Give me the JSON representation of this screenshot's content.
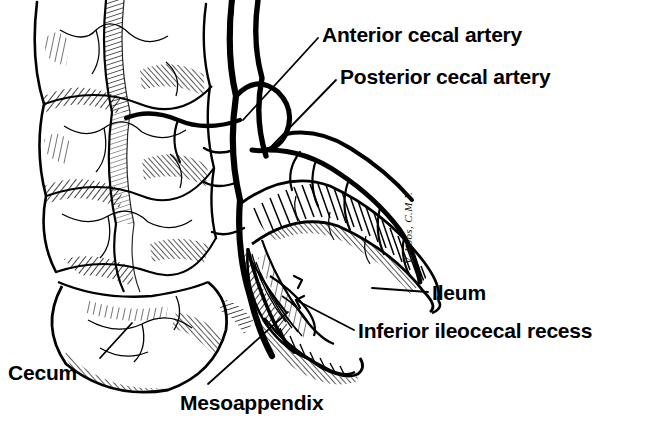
{
  "figure": {
    "type": "anatomical-line-illustration",
    "background_color": "#ffffff",
    "ink_color": "#000000",
    "signature": "V. Loos, C.M.I."
  },
  "labels": [
    {
      "id": "anterior-cecal-artery",
      "text": "Anterior cecal artery",
      "x": 322,
      "y": 24,
      "size": 21
    },
    {
      "id": "posterior-cecal-artery",
      "text": "Posterior cecal artery",
      "x": 340,
      "y": 66,
      "size": 21
    },
    {
      "id": "ileum",
      "text": "Ileum",
      "x": 432,
      "y": 282,
      "size": 21
    },
    {
      "id": "inferior-ileocecal-recess",
      "text": "Inferior ileocecal recess",
      "x": 358,
      "y": 320,
      "size": 21
    },
    {
      "id": "cecum",
      "text": "Cecum",
      "x": 8,
      "y": 362,
      "size": 21
    },
    {
      "id": "mesoappendix",
      "text": "Mesoappendix",
      "x": 180,
      "y": 392,
      "size": 21
    }
  ],
  "leaders": [
    {
      "id": "leader-anterior-cecal-artery",
      "from": [
        318,
        38
      ],
      "to": [
        243,
        120
      ]
    },
    {
      "id": "leader-posterior-cecal-artery",
      "from": [
        336,
        80
      ],
      "to": [
        268,
        150
      ]
    },
    {
      "id": "leader-ileum",
      "from": [
        428,
        292
      ],
      "to": [
        372,
        288
      ]
    },
    {
      "id": "leader-inferior-ileocecal-recess",
      "from": [
        354,
        330
      ],
      "to": [
        296,
        300
      ]
    },
    {
      "id": "leader-cecum",
      "from": [
        100,
        358
      ],
      "to": [
        132,
        323
      ]
    },
    {
      "id": "leader-mesoappendix",
      "from": [
        208,
        384
      ],
      "to": [
        288,
        312
      ]
    }
  ]
}
